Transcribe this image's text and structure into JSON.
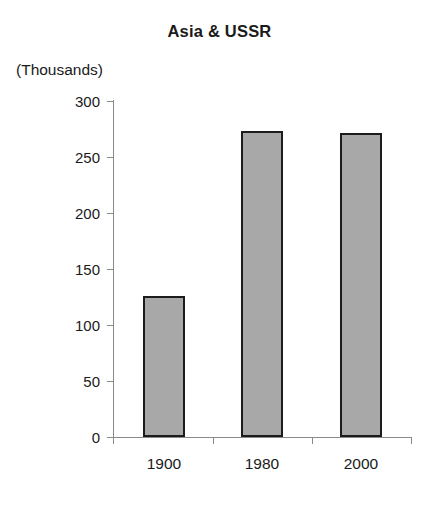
{
  "chart_data": {
    "type": "bar",
    "title": "Asia & USSR",
    "units_label": "(Thousands)",
    "xlabel": "",
    "ylabel": "",
    "categories": [
      "1900",
      "1980",
      "2000"
    ],
    "values": [
      126,
      273,
      271
    ],
    "series": [
      {
        "name": "Asia & USSR",
        "values": [
          126,
          273,
          271
        ]
      }
    ],
    "ylim": [
      0,
      300
    ],
    "yticks": [
      0,
      50,
      100,
      150,
      200,
      250,
      300
    ],
    "ytick_labels": [
      "0",
      "50",
      "100",
      "150",
      "200",
      "250",
      "300"
    ],
    "grid": false,
    "legend": "none",
    "bar_fill_color": "#a8a8a8",
    "bar_edge_color": "#1c1c1c",
    "axis_color": "#8a8a8a",
    "background_color": "#ffffff"
  }
}
